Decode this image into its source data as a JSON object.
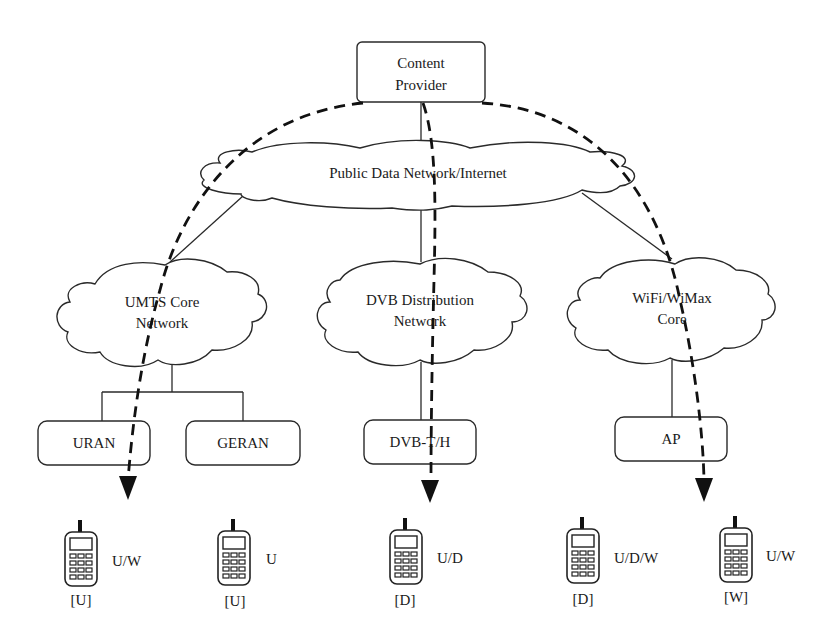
{
  "diagram": {
    "content_provider": {
      "line1": "Content",
      "line2": "Provider"
    },
    "internet_cloud": {
      "label": "Public Data Network/Internet"
    },
    "core_networks": [
      {
        "line1": "UMTS Core",
        "line2": "Network"
      },
      {
        "line1": "DVB Distribution",
        "line2": "Network"
      },
      {
        "line1": "WiFi/WiMax",
        "line2": "Core"
      }
    ],
    "access_nodes": [
      {
        "label": "URAN"
      },
      {
        "label": "GERAN"
      },
      {
        "label": "DVB-T/H"
      },
      {
        "label": "AP"
      }
    ],
    "terminals": [
      {
        "capability": "U/W",
        "current": "[U]"
      },
      {
        "capability": "U",
        "current": "[U]"
      },
      {
        "capability": "U/D",
        "current": "[D]"
      },
      {
        "capability": "U/D/W",
        "current": "[D]"
      },
      {
        "capability": "U/W",
        "current": "[W]"
      }
    ],
    "colors": {
      "line": "#2a2a2a",
      "dashed_path": "#111111",
      "background": "#ffffff"
    }
  }
}
